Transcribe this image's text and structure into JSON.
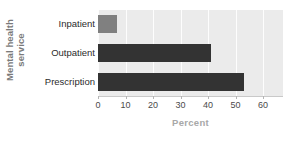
{
  "chart_data": {
    "type": "bar",
    "orientation": "horizontal",
    "title": "",
    "xlabel": "Percent",
    "ylabel": "Mental health service",
    "ylabel_line1": "Mental health",
    "ylabel_line2": "service",
    "categories": [
      "Inpatient",
      "Outpatient",
      "Prescription"
    ],
    "values": [
      7,
      41,
      53
    ],
    "xlim": [
      0,
      60
    ],
    "xticks": [
      0,
      10,
      20,
      30,
      40,
      50,
      60
    ],
    "xtick_labels": [
      "0",
      "10",
      "20",
      "30",
      "40",
      "50",
      "60"
    ],
    "grid": true,
    "grid_axis": "x",
    "legend": false,
    "bar_colors": [
      "#808080",
      "#333333",
      "#333333"
    ],
    "plot_background": "#ebebeb",
    "gridline_color": "#fdfdfd",
    "axis_color": "#c9c9c9",
    "xlabel_color": "#a8a8a8",
    "ylabel_color": "#7a7a7a",
    "tick_label_color": "#4a4a4a",
    "category_label_color": "#2b2b2b"
  }
}
